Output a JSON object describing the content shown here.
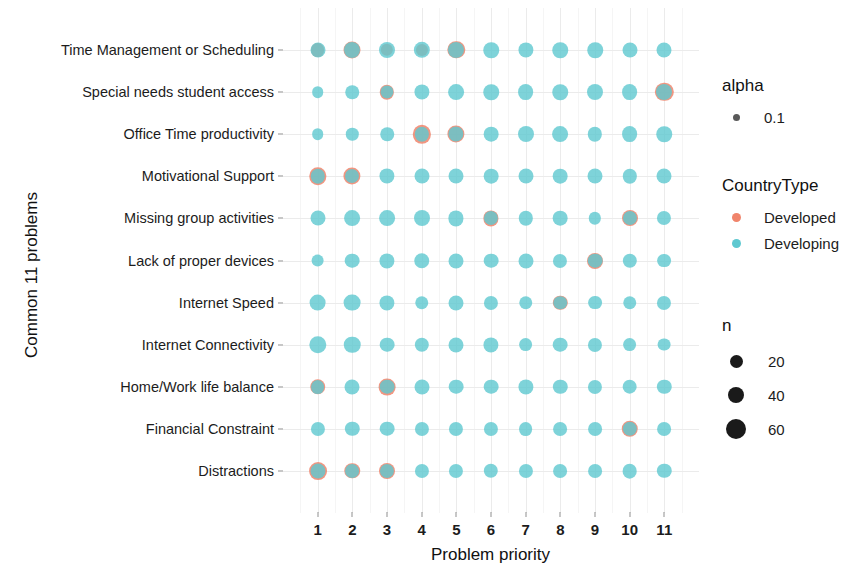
{
  "chart_data": {
    "type": "scatter",
    "title": "",
    "xlabel": "Problem priority",
    "ylabel": "Common 11 problems",
    "x_ticks": [
      "1",
      "2",
      "3",
      "4",
      "5",
      "6",
      "7",
      "8",
      "9",
      "10",
      "11"
    ],
    "xlim": [
      0.5,
      11.5
    ],
    "grid": true,
    "legend_position": "right",
    "categories": [
      "Time Management or Scheduling",
      "Special needs student access",
      "Office Time productivity",
      "Motivational Support",
      "Missing group activities",
      "Lack of proper devices",
      "Internet Speed",
      "Internet Connectivity",
      "Home/Work life balance",
      "Financial Constraint",
      "Distractions"
    ],
    "colors": {
      "Developed": "#f0846b",
      "Developing": "#5ec8d0"
    },
    "alpha": 0.1,
    "size_legend": {
      "title": "n",
      "values": [
        20,
        40,
        60
      ],
      "px": [
        11,
        14,
        18
      ]
    },
    "series": [
      {
        "name": "Developed",
        "points": [
          {
            "row": 0,
            "x": 1,
            "n": 14
          },
          {
            "row": 0,
            "x": 2,
            "n": 26
          },
          {
            "row": 0,
            "x": 3,
            "n": 10
          },
          {
            "row": 0,
            "x": 4,
            "n": 9
          },
          {
            "row": 0,
            "x": 5,
            "n": 28
          },
          {
            "row": 1,
            "x": 3,
            "n": 16
          },
          {
            "row": 1,
            "x": 11,
            "n": 32
          },
          {
            "row": 2,
            "x": 4,
            "n": 32
          },
          {
            "row": 2,
            "x": 5,
            "n": 27
          },
          {
            "row": 3,
            "x": 1,
            "n": 28
          },
          {
            "row": 3,
            "x": 2,
            "n": 27
          },
          {
            "row": 4,
            "x": 6,
            "n": 19
          },
          {
            "row": 4,
            "x": 10,
            "n": 22
          },
          {
            "row": 5,
            "x": 9,
            "n": 22
          },
          {
            "row": 6,
            "x": 8,
            "n": 16
          },
          {
            "row": 8,
            "x": 1,
            "n": 20
          },
          {
            "row": 8,
            "x": 3,
            "n": 25
          },
          {
            "row": 9,
            "x": 10,
            "n": 24
          },
          {
            "row": 10,
            "x": 1,
            "n": 30
          },
          {
            "row": 10,
            "x": 2,
            "n": 20
          },
          {
            "row": 10,
            "x": 3,
            "n": 22
          }
        ]
      },
      {
        "name": "Developing",
        "points": [
          {
            "row": 0,
            "x": 1,
            "n": 18
          },
          {
            "row": 0,
            "x": 2,
            "n": 22
          },
          {
            "row": 0,
            "x": 3,
            "n": 22
          },
          {
            "row": 0,
            "x": 4,
            "n": 23
          },
          {
            "row": 0,
            "x": 5,
            "n": 22
          },
          {
            "row": 0,
            "x": 6,
            "n": 20
          },
          {
            "row": 0,
            "x": 7,
            "n": 19
          },
          {
            "row": 0,
            "x": 8,
            "n": 20
          },
          {
            "row": 0,
            "x": 9,
            "n": 20
          },
          {
            "row": 0,
            "x": 10,
            "n": 18
          },
          {
            "row": 0,
            "x": 11,
            "n": 18
          },
          {
            "row": 1,
            "x": 1,
            "n": 8
          },
          {
            "row": 1,
            "x": 2,
            "n": 13
          },
          {
            "row": 1,
            "x": 3,
            "n": 12
          },
          {
            "row": 1,
            "x": 4,
            "n": 19
          },
          {
            "row": 1,
            "x": 5,
            "n": 21
          },
          {
            "row": 1,
            "x": 6,
            "n": 20
          },
          {
            "row": 1,
            "x": 7,
            "n": 21
          },
          {
            "row": 1,
            "x": 8,
            "n": 20
          },
          {
            "row": 1,
            "x": 9,
            "n": 22
          },
          {
            "row": 1,
            "x": 10,
            "n": 21
          },
          {
            "row": 1,
            "x": 11,
            "n": 22
          },
          {
            "row": 2,
            "x": 1,
            "n": 8
          },
          {
            "row": 2,
            "x": 2,
            "n": 10
          },
          {
            "row": 2,
            "x": 3,
            "n": 13
          },
          {
            "row": 2,
            "x": 4,
            "n": 16
          },
          {
            "row": 2,
            "x": 5,
            "n": 19
          },
          {
            "row": 2,
            "x": 6,
            "n": 17
          },
          {
            "row": 2,
            "x": 7,
            "n": 22
          },
          {
            "row": 2,
            "x": 8,
            "n": 21
          },
          {
            "row": 2,
            "x": 9,
            "n": 16
          },
          {
            "row": 2,
            "x": 10,
            "n": 21
          },
          {
            "row": 2,
            "x": 11,
            "n": 20
          },
          {
            "row": 3,
            "x": 1,
            "n": 16
          },
          {
            "row": 3,
            "x": 2,
            "n": 15
          },
          {
            "row": 3,
            "x": 3,
            "n": 19
          },
          {
            "row": 3,
            "x": 4,
            "n": 18
          },
          {
            "row": 3,
            "x": 5,
            "n": 18
          },
          {
            "row": 3,
            "x": 6,
            "n": 17
          },
          {
            "row": 3,
            "x": 7,
            "n": 18
          },
          {
            "row": 3,
            "x": 8,
            "n": 17
          },
          {
            "row": 3,
            "x": 9,
            "n": 18
          },
          {
            "row": 3,
            "x": 10,
            "n": 16
          },
          {
            "row": 3,
            "x": 11,
            "n": 18
          },
          {
            "row": 4,
            "x": 1,
            "n": 18
          },
          {
            "row": 4,
            "x": 2,
            "n": 21
          },
          {
            "row": 4,
            "x": 3,
            "n": 21
          },
          {
            "row": 4,
            "x": 4,
            "n": 22
          },
          {
            "row": 4,
            "x": 5,
            "n": 19
          },
          {
            "row": 4,
            "x": 6,
            "n": 15
          },
          {
            "row": 4,
            "x": 7,
            "n": 16
          },
          {
            "row": 4,
            "x": 8,
            "n": 17
          },
          {
            "row": 4,
            "x": 9,
            "n": 10
          },
          {
            "row": 4,
            "x": 10,
            "n": 15
          },
          {
            "row": 4,
            "x": 11,
            "n": 15
          },
          {
            "row": 5,
            "x": 1,
            "n": 11
          },
          {
            "row": 5,
            "x": 2,
            "n": 17
          },
          {
            "row": 5,
            "x": 3,
            "n": 19
          },
          {
            "row": 5,
            "x": 4,
            "n": 20
          },
          {
            "row": 5,
            "x": 5,
            "n": 18
          },
          {
            "row": 5,
            "x": 6,
            "n": 17
          },
          {
            "row": 5,
            "x": 7,
            "n": 18
          },
          {
            "row": 5,
            "x": 8,
            "n": 15
          },
          {
            "row": 5,
            "x": 9,
            "n": 17
          },
          {
            "row": 5,
            "x": 10,
            "n": 16
          },
          {
            "row": 5,
            "x": 11,
            "n": 14
          },
          {
            "row": 6,
            "x": 1,
            "n": 25
          },
          {
            "row": 6,
            "x": 2,
            "n": 25
          },
          {
            "row": 6,
            "x": 3,
            "n": 19
          },
          {
            "row": 6,
            "x": 4,
            "n": 13
          },
          {
            "row": 6,
            "x": 5,
            "n": 18
          },
          {
            "row": 6,
            "x": 6,
            "n": 15
          },
          {
            "row": 6,
            "x": 7,
            "n": 13
          },
          {
            "row": 6,
            "x": 8,
            "n": 13
          },
          {
            "row": 6,
            "x": 9,
            "n": 14
          },
          {
            "row": 6,
            "x": 10,
            "n": 13
          },
          {
            "row": 6,
            "x": 11,
            "n": 15
          },
          {
            "row": 7,
            "x": 1,
            "n": 28
          },
          {
            "row": 7,
            "x": 2,
            "n": 24
          },
          {
            "row": 7,
            "x": 3,
            "n": 17
          },
          {
            "row": 7,
            "x": 4,
            "n": 16
          },
          {
            "row": 7,
            "x": 5,
            "n": 18
          },
          {
            "row": 7,
            "x": 6,
            "n": 19
          },
          {
            "row": 7,
            "x": 7,
            "n": 14
          },
          {
            "row": 7,
            "x": 8,
            "n": 17
          },
          {
            "row": 7,
            "x": 9,
            "n": 15
          },
          {
            "row": 7,
            "x": 10,
            "n": 14
          },
          {
            "row": 7,
            "x": 11,
            "n": 11
          },
          {
            "row": 8,
            "x": 1,
            "n": 14
          },
          {
            "row": 8,
            "x": 2,
            "n": 18
          },
          {
            "row": 8,
            "x": 3,
            "n": 17
          },
          {
            "row": 8,
            "x": 4,
            "n": 18
          },
          {
            "row": 8,
            "x": 5,
            "n": 17
          },
          {
            "row": 8,
            "x": 6,
            "n": 17
          },
          {
            "row": 8,
            "x": 7,
            "n": 19
          },
          {
            "row": 8,
            "x": 8,
            "n": 16
          },
          {
            "row": 8,
            "x": 9,
            "n": 15
          },
          {
            "row": 8,
            "x": 10,
            "n": 17
          },
          {
            "row": 8,
            "x": 11,
            "n": 16
          },
          {
            "row": 9,
            "x": 1,
            "n": 15
          },
          {
            "row": 9,
            "x": 2,
            "n": 16
          },
          {
            "row": 9,
            "x": 3,
            "n": 17
          },
          {
            "row": 9,
            "x": 4,
            "n": 15
          },
          {
            "row": 9,
            "x": 5,
            "n": 15
          },
          {
            "row": 9,
            "x": 6,
            "n": 15
          },
          {
            "row": 9,
            "x": 7,
            "n": 14
          },
          {
            "row": 9,
            "x": 8,
            "n": 14
          },
          {
            "row": 9,
            "x": 9,
            "n": 14
          },
          {
            "row": 9,
            "x": 10,
            "n": 16
          },
          {
            "row": 9,
            "x": 11,
            "n": 14
          },
          {
            "row": 10,
            "x": 1,
            "n": 18
          },
          {
            "row": 10,
            "x": 2,
            "n": 14
          },
          {
            "row": 10,
            "x": 3,
            "n": 15
          },
          {
            "row": 10,
            "x": 4,
            "n": 15
          },
          {
            "row": 10,
            "x": 5,
            "n": 15
          },
          {
            "row": 10,
            "x": 6,
            "n": 16
          },
          {
            "row": 10,
            "x": 7,
            "n": 15
          },
          {
            "row": 10,
            "x": 8,
            "n": 14
          },
          {
            "row": 10,
            "x": 9,
            "n": 14
          },
          {
            "row": 10,
            "x": 10,
            "n": 17
          },
          {
            "row": 10,
            "x": 11,
            "n": 16
          }
        ]
      }
    ]
  },
  "legends": {
    "alpha": {
      "title": "alpha",
      "entries": [
        {
          "label": "0.1",
          "color": "#595959",
          "px": 7
        }
      ]
    },
    "country_type": {
      "title": "CountryType",
      "entries": [
        {
          "label": "Developed",
          "color": "#f0846b",
          "px": 9
        },
        {
          "label": "Developing",
          "color": "#5ec8d0",
          "px": 9
        }
      ]
    },
    "n": {
      "title": "n",
      "entries": [
        {
          "label": "20",
          "color": "#1a1a1a",
          "px": 13
        },
        {
          "label": "40",
          "color": "#1a1a1a",
          "px": 16
        },
        {
          "label": "60",
          "color": "#1a1a1a",
          "px": 20
        }
      ]
    }
  }
}
